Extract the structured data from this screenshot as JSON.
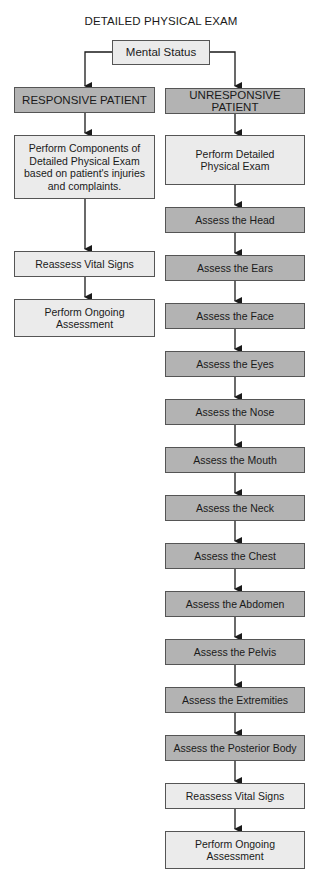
{
  "title": "DETAILED PHYSICAL EXAM",
  "root": {
    "label": "Mental Status"
  },
  "branches": {
    "responsive": {
      "header": "RESPONSIVE PATIENT",
      "steps": [
        "Perform Components of Detailed Physical Exam based on patient's injuries and complaints.",
        "Reassess Vital Signs",
        "Perform Ongoing Assessment"
      ]
    },
    "unresponsive": {
      "header": "UNRESPONSIVE PATIENT",
      "steps": [
        "Perform Detailed Physical Exam",
        "Assess the Head",
        "Assess the Ears",
        "Assess the Face",
        "Assess the Eyes",
        "Assess the Nose",
        "Assess the Mouth",
        "Assess the Neck",
        "Assess the Chest",
        "Assess the Abdomen",
        "Assess the Pelvis",
        "Assess the Extremities",
        "Assess the Posterior Body",
        "Reassess Vital Signs",
        "Perform Ongoing Assessment"
      ]
    }
  },
  "colors": {
    "light_box": "#ebebeb",
    "dark_box": "#b3b3b3",
    "line": "#1a1a1a"
  }
}
